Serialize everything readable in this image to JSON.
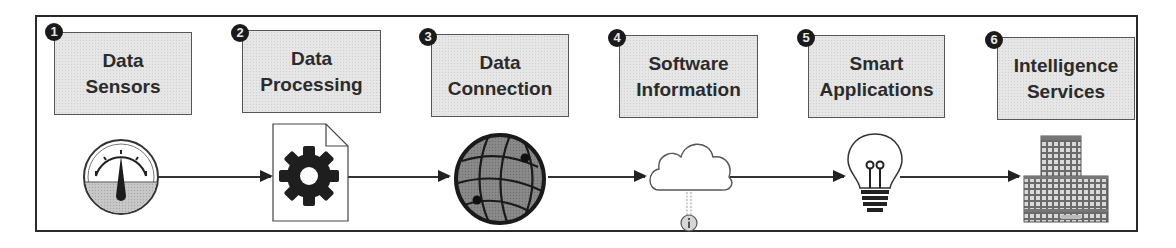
{
  "diagram": {
    "title": "",
    "stages": [
      {
        "number": "1",
        "label_line1": "Data",
        "label_line2": "Sensors",
        "icon": "gauge-icon"
      },
      {
        "number": "2",
        "label_line1": "Data",
        "label_line2": "Processing",
        "icon": "gear-document-icon"
      },
      {
        "number": "3",
        "label_line1": "Data",
        "label_line2": "Connection",
        "icon": "globe-network-icon"
      },
      {
        "number": "4",
        "label_line1": "Software",
        "label_line2": "Information",
        "icon": "cloud-info-icon"
      },
      {
        "number": "5",
        "label_line1": "Smart",
        "label_line2": "Applications",
        "icon": "lightbulb-icon"
      },
      {
        "number": "6",
        "label_line1": "Intelligence",
        "label_line2": "Services",
        "icon": "buildings-icon"
      }
    ],
    "connections": [
      {
        "from": "1",
        "to": "2"
      },
      {
        "from": "2",
        "to": "3"
      },
      {
        "from": "3",
        "to": "4"
      },
      {
        "from": "4",
        "to": "5"
      },
      {
        "from": "5",
        "to": "6"
      }
    ],
    "colors": {
      "box_fill": "#e6e6e6",
      "box_border": "#555555",
      "badge": "#1a1a1a",
      "text": "#2b2b2b",
      "line": "#333333"
    }
  }
}
